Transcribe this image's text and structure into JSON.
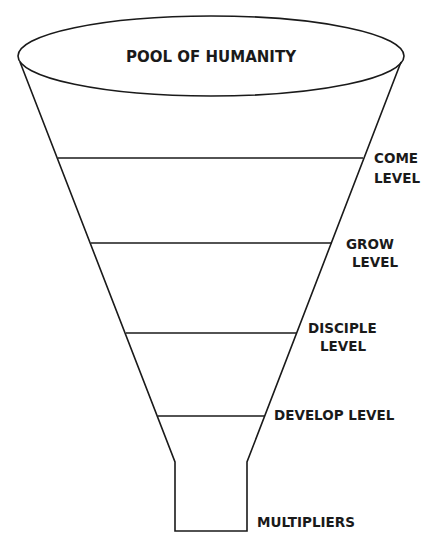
{
  "diagram": {
    "type": "funnel",
    "top_label": "POOL OF HUMANITY",
    "levels": [
      {
        "line1": "COME",
        "line2": "LEVEL"
      },
      {
        "line1": "GROW",
        "line2": "LEVEL"
      },
      {
        "line1": "DISCIPLE",
        "line2": "LEVEL"
      },
      {
        "line1": "DEVELOP LEVEL",
        "line2": ""
      }
    ],
    "bottom_label": "MULTIPLIERS",
    "colors": {
      "line": "#1a1a1a",
      "background": "#ffffff"
    }
  }
}
